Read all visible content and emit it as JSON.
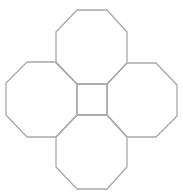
{
  "diagram": {
    "stroke_color": "#a8a8a8",
    "background": "#ffffff",
    "shapes": {
      "octagon_top": "77,10 107,10 127,32 127,63 107,84 77,84 56,63 56,32",
      "octagon_left": "27,62 56,62 77,84 77,115 56,137 27,137 6,115 6,83",
      "octagon_right": "127,63 156,63 177,85 177,116 156,137 127,137 107,115 107,84",
      "octagon_bottom": "77,115 107,115 127,137 127,167 107,189 77,189 56,167 56,137",
      "center_square": "77,84 107,84 107,115 77,115"
    }
  }
}
